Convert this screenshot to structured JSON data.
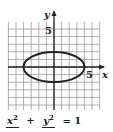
{
  "figure": {
    "axes": {
      "x_label": "x",
      "y_label": "y",
      "x_tick_label": "5",
      "y_tick_label": "5",
      "grid_range": [
        -6,
        6
      ]
    },
    "curve": {
      "type": "ellipse",
      "center": [
        0,
        0
      ],
      "semi_x": 4,
      "semi_y": 2,
      "stroke": "#222222"
    },
    "equation": {
      "term1_numerator": "x",
      "term1_power": "2",
      "plus": "+",
      "term2_numerator": "y",
      "term2_power": "2",
      "equals": "= 1"
    },
    "colors": {
      "grid": "#9a9a9a",
      "axis": "#222222",
      "background": "#ffffff"
    }
  }
}
